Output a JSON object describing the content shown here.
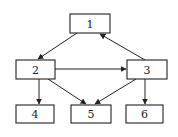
{
  "diagram": {
    "type": "directed-graph",
    "nodes": [
      {
        "id": "1",
        "label": "1",
        "x": 70,
        "y": 14,
        "w": 40,
        "h": 19
      },
      {
        "id": "2",
        "label": "2",
        "x": 16,
        "y": 60,
        "w": 39,
        "h": 19
      },
      {
        "id": "3",
        "label": "3",
        "x": 127,
        "y": 60,
        "w": 40,
        "h": 19
      },
      {
        "id": "4",
        "label": "4",
        "x": 16,
        "y": 105,
        "w": 38,
        "h": 18
      },
      {
        "id": "5",
        "label": "5",
        "x": 71,
        "y": 105,
        "w": 40,
        "h": 18
      },
      {
        "id": "6",
        "label": "6",
        "x": 126,
        "y": 105,
        "w": 37,
        "h": 18
      }
    ],
    "edges": [
      {
        "from": "1",
        "to": "2"
      },
      {
        "from": "3",
        "to": "1"
      },
      {
        "from": "2",
        "to": "3"
      },
      {
        "from": "2",
        "to": "4"
      },
      {
        "from": "2",
        "to": "5"
      },
      {
        "from": "3",
        "to": "5"
      },
      {
        "from": "3",
        "to": "6"
      }
    ],
    "colors": {
      "stroke": "#222222",
      "fill": "#ffffff"
    }
  }
}
